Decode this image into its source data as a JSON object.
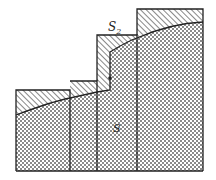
{
  "diagram": {
    "labels": {
      "region_below": "S",
      "region_excess_main": "S",
      "region_excess_sub": "2"
    },
    "colors": {
      "stroke": "#222222",
      "background": "#ffffff",
      "checker_dark": "#8a8a8a",
      "checker_light": "#ffffff",
      "hatch": "#555555"
    },
    "columns": [
      {
        "x0": 16,
        "x1": 70,
        "top": 90
      },
      {
        "x0": 70,
        "x1": 97,
        "top": 81
      },
      {
        "x0": 97,
        "x1": 137,
        "top": 35
      },
      {
        "x0": 137,
        "x1": 203,
        "top": 9
      }
    ],
    "baseline": 171,
    "curve_points": [
      [
        16,
        115
      ],
      [
        40,
        106
      ],
      [
        70,
        98
      ],
      [
        97,
        92
      ],
      [
        110,
        52
      ],
      [
        137,
        38
      ],
      [
        160,
        30
      ],
      [
        180,
        24
      ],
      [
        203,
        22
      ]
    ],
    "marker_point": [
      110,
      78
    ]
  }
}
